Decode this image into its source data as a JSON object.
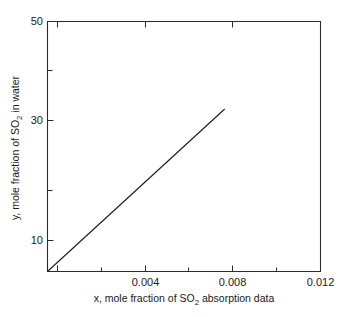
{
  "chart_data": {
    "type": "line",
    "title": "",
    "xlabel_parts": {
      "pre": "x, mole fraction of SO",
      "sub": "2",
      "post": " absorption data"
    },
    "ylabel_parts": {
      "pre": "y, mole fraction of SO",
      "sub": "2",
      "post": " in water"
    },
    "xlabel": "x, mole fraction of SO2 absorption data",
    "ylabel": "y, mole fraction of SO2 in water",
    "xlim": [
      0.0006,
      0.012
    ],
    "ylim": [
      4.3,
      50
    ],
    "grid": false,
    "legend": "none",
    "x_major_ticks": [
      0.004,
      0.008,
      0.012
    ],
    "x_major_tick_labels": [
      "0.004",
      "0.008",
      "0.012"
    ],
    "x_minor_ticks": [
      0.002,
      0.006,
      0.01
    ],
    "y_major_ticks": [
      10,
      30,
      50
    ],
    "y_major_tick_labels": [
      "10",
      "30",
      "50"
    ],
    "y_minor_ticks": [
      20,
      40
    ],
    "series": [
      {
        "name": "SO2 absorption equilibrium",
        "x": [
          0.0006,
          0.008
        ],
        "y": [
          4.3,
          34.0
        ]
      }
    ]
  }
}
